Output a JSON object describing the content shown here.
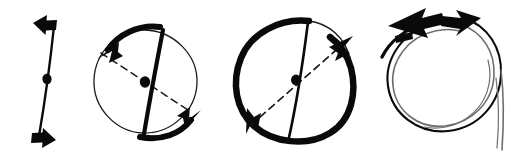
{
  "figure": {
    "background_color": "#ffffff",
    "ink_color": "#0a0a0a",
    "thin_ink_color": "#1a1a1a",
    "faint_ink_color": "#6e6e6e",
    "width": 518,
    "height": 163
  },
  "panels": [
    {
      "id": "panel-1",
      "name": "axis-with-double-arrow",
      "description": "Near-vertical straight line with a filled dot at its midpoint and an arrowhead at each end pointing in opposite horizontal directions",
      "elements": [
        {
          "name": "axis-line",
          "kind": "line",
          "x1": 54,
          "y1": 24,
          "x2": 38,
          "y2": 138
        },
        {
          "name": "center-dot",
          "kind": "dot",
          "cx": 47,
          "cy": 78,
          "r": 4
        },
        {
          "name": "top-arrowhead",
          "kind": "arrowhead",
          "x": 40,
          "y": 22,
          "direction": "left"
        },
        {
          "name": "bottom-arrowhead",
          "kind": "arrowhead",
          "x": 50,
          "y": 140,
          "direction": "right"
        }
      ]
    },
    {
      "id": "panel-2",
      "name": "circle-thick-chord-with-rotation-arcs",
      "description": "Thin circle with a thick near-vertical chord through the centre dot, a dashed diagonal through the centre, and two thick tangential arcs with arrowheads",
      "elements": [
        {
          "name": "circle-outline",
          "kind": "circle",
          "cx": 145,
          "cy": 82,
          "r": 52
        },
        {
          "name": "thick-chord",
          "kind": "chord",
          "x1": 163,
          "y1": 30,
          "x2": 133,
          "y2": 135
        },
        {
          "name": "dashed-diagonal",
          "kind": "dashed",
          "x1": 101,
          "y1": 53,
          "x2": 191,
          "y2": 112
        },
        {
          "name": "center-dot",
          "kind": "dot",
          "cx": 145,
          "cy": 82,
          "r": 4
        },
        {
          "name": "upper-left-arc",
          "kind": "arc",
          "arrow_at": "end",
          "arrow_direction": "down-left"
        },
        {
          "name": "lower-right-arc",
          "kind": "arc",
          "arrow_at": "end",
          "arrow_direction": "up-right"
        }
      ]
    },
    {
      "id": "panel-3",
      "name": "thick-circle-thin-chord-with-rotation-arcs",
      "description": "Thick sketchy circle with a thin near-vertical chord through the centre dot, a dashed diagonal, and arrowheads on the circle at lower-left and upper-right",
      "elements": [
        {
          "name": "circle-outline",
          "kind": "circle",
          "cx": 294,
          "cy": 82,
          "r": 59
        },
        {
          "name": "thin-chord",
          "kind": "chord",
          "x1": 308,
          "y1": 26,
          "x2": 286,
          "y2": 141
        },
        {
          "name": "dashed-diagonal",
          "kind": "dashed",
          "x1": 248,
          "y1": 122,
          "x2": 342,
          "y2": 44
        },
        {
          "name": "center-dot",
          "kind": "dot",
          "cx": 296,
          "cy": 80,
          "r": 4
        },
        {
          "name": "lower-left-arrowhead",
          "kind": "arrowhead",
          "x": 251,
          "y": 125,
          "direction": "down-left"
        },
        {
          "name": "upper-right-arrowhead",
          "kind": "arrowhead",
          "x": 343,
          "y": 44,
          "direction": "up-right"
        }
      ]
    },
    {
      "id": "panel-4",
      "name": "spiral-loop-with-double-arrowheads",
      "description": "Sketchy double-looped spiral circle whose open tail drops below the loop on the right, with two overlapping thick arrowheads at the top pointing left and right",
      "elements": [
        {
          "name": "outer-loop",
          "kind": "spiral-loop"
        },
        {
          "name": "inner-loop",
          "kind": "spiral-loop"
        },
        {
          "name": "spiral-tail",
          "kind": "tail"
        },
        {
          "name": "left-arrowhead",
          "kind": "arrowhead",
          "x": 404,
          "y": 22,
          "direction": "left"
        },
        {
          "name": "right-arrowhead",
          "kind": "arrowhead",
          "x": 466,
          "y": 18,
          "direction": "right"
        }
      ]
    }
  ]
}
